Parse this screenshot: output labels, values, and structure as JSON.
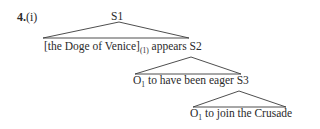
{
  "example": {
    "number": "4.",
    "label": "(i)"
  },
  "tree": {
    "root": "S1",
    "level1": {
      "bracket_text": "[the Doge of Venice]",
      "index": "(1)",
      "verb": " appears ",
      "node": "S2"
    },
    "level2": {
      "subject": "O",
      "index": "1",
      "rest": " to have been eager ",
      "node": "S3"
    },
    "level3": {
      "subject": "O",
      "index": "1",
      "rest": " to join the Crusade"
    }
  },
  "colors": {
    "text": "#2a2a2a",
    "lines": "#3a3a3a"
  }
}
